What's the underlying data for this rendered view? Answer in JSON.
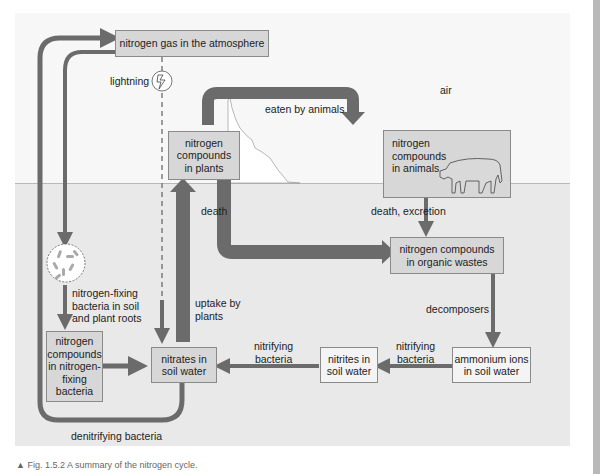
{
  "diagram": {
    "title": "The nitrogen cycle",
    "regions": {
      "air_label": "air"
    },
    "nodes": {
      "atmosphere": "nitrogen gas in the atmosphere",
      "plants": "nitrogen\ncompounds\nin plants",
      "animals": "nitrogen\ncompounds\nin animals",
      "organic_wastes": "nitrogen compounds\nin organic wastes",
      "ammonium": "ammonium ions\nin soil water",
      "nitrites": "nitrites in\nsoil water",
      "nitrates": "nitrates in\nsoil water",
      "fixing_bacteria_compounds": "nitrogen\ncompounds\nin nitrogen-\nfixing\nbacteria"
    },
    "edges": {
      "lightning": "lightning",
      "eaten": "eaten by animals",
      "death_plants": "death",
      "death_excretion": "death, excretion",
      "decomposers": "decomposers",
      "nitrifying_1": "nitrifying\nbacteria",
      "nitrifying_2": "nitrifying\nbacteria",
      "uptake": "uptake by\nplants",
      "fixing": "nitrogen-fixing\nbacteria in soil\nand plant roots",
      "denitrifying": "denitrifying bacteria"
    },
    "icons": {
      "lightning": "lightning-bolt-icon",
      "bacteria": "bacteria-circle-icon",
      "cow": "cow-icon"
    },
    "colors": {
      "arrow": "#6b6b6b",
      "box_fill": "#d7d7d7",
      "box_fill_light": "#f4f4f4",
      "sky": "#f7f7f7",
      "soil": "#e9e9e9"
    }
  },
  "caption": "▲ Fig. 1.5.2  A summary of the nitrogen cycle."
}
